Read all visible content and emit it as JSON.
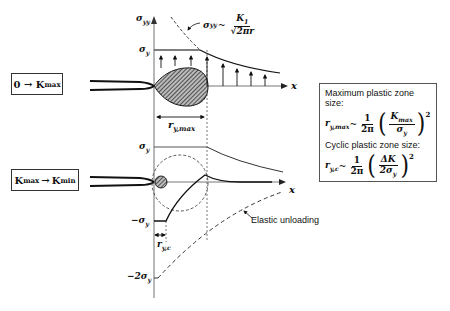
{
  "stages": {
    "loading": {
      "label": "0 → K",
      "sub": "max"
    },
    "unloading": {
      "from": "K",
      "from_sub": "max",
      "arrow": "→",
      "to": "K",
      "to_sub": "min"
    }
  },
  "top_plot": {
    "y_axis_label": "σ",
    "y_axis_sub": "yy",
    "x_axis_label": "x",
    "yield_label": "σ",
    "yield_sub": "y",
    "elastic_eq_lhs": "σ",
    "elastic_eq_lhs_sub": "yy",
    "elastic_eq_tilde": "~",
    "elastic_eq_num": "K",
    "elastic_eq_num_sub": "1",
    "elastic_eq_den": "√2πr",
    "zone_label": "r",
    "zone_sub": "y,max"
  },
  "bottom_plot": {
    "yield_label": "σ",
    "yield_sub": "y",
    "neg_yield_label": "−σ",
    "neg_yield_sub": "y",
    "neg2_yield_label": "−2σ",
    "neg2_yield_sub": "y",
    "x_axis_label": "x",
    "zone_label": "r",
    "zone_sub": "y,c",
    "annotation": "Elastic unloading"
  },
  "formula_box": {
    "max_title": "Maximum plastic zone size:",
    "max_lhs": "r",
    "max_lhs_sub": "y,max",
    "tilde": "~",
    "one": "1",
    "two_pi": "2π",
    "max_num": "K",
    "max_num_sub": "max",
    "max_den": "σ",
    "max_den_sub": "y",
    "exponent": "2",
    "cyc_title": "Cyclic plastic zone size:",
    "cyc_lhs": "r",
    "cyc_lhs_sub": "y,c",
    "cyc_num": "ΔK",
    "cyc_den": "2σ",
    "cyc_den_sub": "y"
  }
}
